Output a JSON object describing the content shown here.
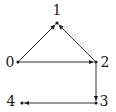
{
  "diagram": {
    "type": "directed-graph",
    "nodes": [
      {
        "id": "0",
        "label": "0",
        "x": 18,
        "y": 62,
        "lx": 10,
        "ly": 67
      },
      {
        "id": "1",
        "label": "1",
        "x": 57,
        "y": 23,
        "lx": 57,
        "ly": 15
      },
      {
        "id": "2",
        "label": "2",
        "x": 96,
        "y": 62,
        "lx": 105,
        "ly": 67
      },
      {
        "id": "3",
        "label": "3",
        "x": 96,
        "y": 103,
        "lx": 104,
        "ly": 106
      },
      {
        "id": "4",
        "label": "4",
        "x": 22,
        "y": 103,
        "lx": 11,
        "ly": 106
      }
    ],
    "edges": [
      {
        "from": "0",
        "to": "1"
      },
      {
        "from": "0",
        "to": "2"
      },
      {
        "from": "2",
        "to": "1"
      },
      {
        "from": "2",
        "to": "3"
      },
      {
        "from": "3",
        "to": "4"
      }
    ],
    "colors": {
      "edge": "#1a1a1a",
      "node": "#1a1a1a",
      "label": "#1a1a1a"
    }
  }
}
